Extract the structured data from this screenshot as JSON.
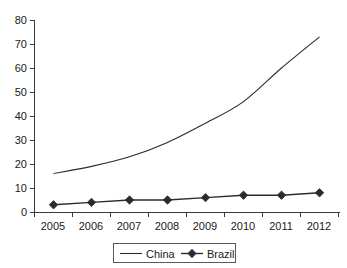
{
  "chart_data": {
    "type": "line",
    "title": "",
    "subtitle": "",
    "xlabel": "",
    "ylabel": "",
    "categories": [
      "2005",
      "2006",
      "2007",
      "2008",
      "2009",
      "2010",
      "2011",
      "2012"
    ],
    "series": [
      {
        "name": "China",
        "values": [
          16,
          19,
          23,
          29,
          37,
          46,
          60,
          73
        ],
        "marker": "none",
        "color": "#2b2b2b"
      },
      {
        "name": "Brazil",
        "values": [
          3,
          4,
          5,
          5,
          6,
          7,
          7,
          8
        ],
        "marker": "diamond",
        "color": "#2b2b2b"
      }
    ],
    "ylim": [
      0,
      80
    ],
    "yticks": [
      0,
      10,
      20,
      30,
      40,
      50,
      60,
      70,
      80
    ],
    "ytick_labels": [
      "0",
      "10",
      "20",
      "30",
      "40",
      "50",
      "60",
      "70",
      "80"
    ],
    "grid": false,
    "legend_position": "bottom",
    "legend_entries": [
      "China",
      "Brazil"
    ]
  },
  "axes": {
    "y_labels": [
      "80",
      "70",
      "60",
      "50",
      "40",
      "30",
      "20",
      "10",
      "0"
    ],
    "x_labels": [
      "2005",
      "2006",
      "2007",
      "2008",
      "2009",
      "2010",
      "2011",
      "2012"
    ]
  },
  "legend": {
    "items": [
      {
        "label": "China",
        "marker": "line"
      },
      {
        "label": "Brazil",
        "marker": "line-diamond"
      }
    ]
  }
}
